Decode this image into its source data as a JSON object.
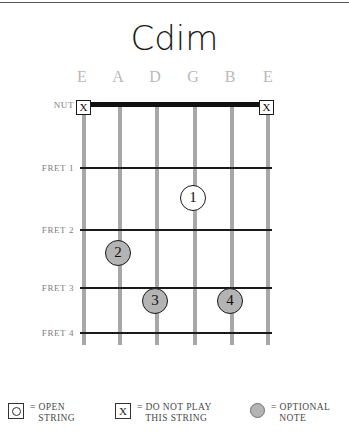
{
  "title": "Cdim",
  "colors": {
    "string": "#a8a8a8",
    "fret": "#1a1a1a",
    "string_label": "#b9b9b9",
    "fret_label": "#7e7e7e",
    "optional_fill": "#b4b4b4",
    "open_fill": "#ffffff",
    "title": "#1a1a1a"
  },
  "strings": [
    {
      "name": "E",
      "order": 1
    },
    {
      "name": "A",
      "order": 2
    },
    {
      "name": "D",
      "order": 3
    },
    {
      "name": "G",
      "order": 4
    },
    {
      "name": "B",
      "order": 5
    },
    {
      "name": "E",
      "order": 6
    }
  ],
  "fret_labels": [
    {
      "label": "NUT"
    },
    {
      "label": "FRET 1"
    },
    {
      "label": "FRET 2"
    },
    {
      "label": "FRET 3"
    },
    {
      "label": "FRET 4"
    }
  ],
  "mutes": [
    {
      "string": "E",
      "string_index": 0,
      "glyph": "X"
    },
    {
      "string": "E",
      "string_index": 5,
      "glyph": "X"
    }
  ],
  "markers": [
    {
      "finger": "1",
      "string": "G",
      "string_index": 3,
      "fret": 1,
      "style": "open"
    },
    {
      "finger": "2",
      "string": "A",
      "string_index": 1,
      "fret": 2,
      "style": "optional"
    },
    {
      "finger": "3",
      "string": "D",
      "string_index": 2,
      "fret": 3,
      "style": "optional"
    },
    {
      "finger": "4",
      "string": "B",
      "string_index": 4,
      "fret": 3,
      "style": "optional"
    }
  ],
  "legend": [
    {
      "icon": "open-string-icon",
      "text": "= OPEN\n   STRING"
    },
    {
      "icon": "do-not-play-icon",
      "text": "= DO NOT PLAY\n   THIS STRING"
    },
    {
      "icon": "optional-note-icon",
      "text": "= OPTIONAL\n   NOTE"
    }
  ]
}
